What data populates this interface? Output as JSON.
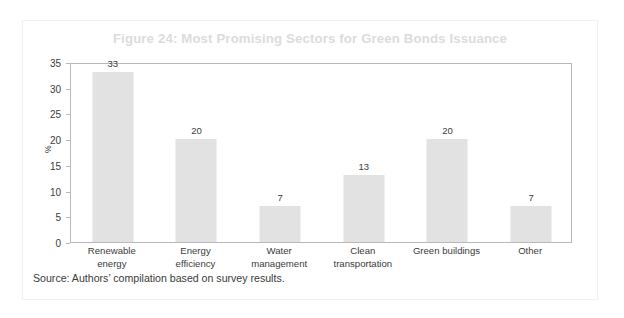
{
  "figure": {
    "title": "Figure 24: Most Promising Sectors for Green Bonds Issuance",
    "source_note": "Source: Authors’ compilation based on survey results.",
    "title_color": "#dcdcdc",
    "bar_color": "#e2e2e2",
    "axis_color": "#b9b9b9",
    "text_color": "#3b3b3b"
  },
  "chart_data": {
    "type": "bar",
    "title": "Figure 24: Most Promising Sectors for Green Bonds Issuance",
    "xlabel": "",
    "ylabel": "%",
    "categories": [
      "Renewable energy",
      "Energy efficiency",
      "Water management",
      "Clean transportation",
      "Green buildings",
      "Other"
    ],
    "category_lines": [
      [
        "Renewable",
        "energy"
      ],
      [
        "Energy",
        "efficiency"
      ],
      [
        "Water",
        "management"
      ],
      [
        "Clean",
        "transportation"
      ],
      [
        "Green buildings"
      ],
      [
        "Other"
      ]
    ],
    "values": [
      33,
      20,
      7,
      13,
      20,
      7
    ],
    "value_labels": [
      "33",
      "20",
      "7",
      "13",
      "20",
      "7"
    ],
    "ylim": [
      0,
      35
    ],
    "yticks": [
      0,
      5,
      10,
      15,
      20,
      25,
      30,
      35
    ],
    "ytick_labels": [
      "0",
      "5",
      "10",
      "15",
      "20",
      "25",
      "30",
      "35"
    ],
    "grid": false,
    "legend": false,
    "legend_position": "none"
  }
}
